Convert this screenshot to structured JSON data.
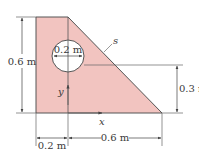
{
  "diagram": {
    "type": "composite-area-with-hole",
    "colors": {
      "fill": "#f2c4c0",
      "outline": "#555555",
      "dimension": "#444444",
      "hole": "#ffffff"
    },
    "labels": {
      "height_total": "0.6 m",
      "hole_diameter": "0.2 m",
      "right_height": "0.3 m",
      "bottom_left": "0.2 m",
      "bottom_right": "0.6 m",
      "curve_label": "s",
      "x_axis": "x",
      "y_axis": "y"
    }
  }
}
